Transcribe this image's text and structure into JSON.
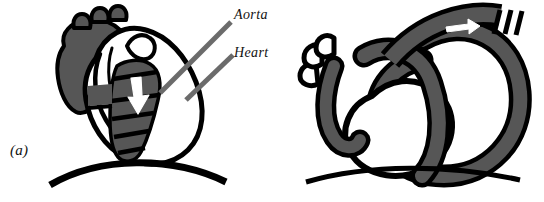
{
  "figure": {
    "background_color": "#ffffff",
    "ink_color": "#000000",
    "tissue_gray": "#565656",
    "leader_gray": "#6b6b6b",
    "highlight_color": "#ffffff"
  },
  "panels": [
    {
      "id": "a",
      "label": "(a)",
      "description": "stylised heart with aorta band",
      "callouts": [
        {
          "name": "aorta",
          "label": "Aorta"
        },
        {
          "name": "heart",
          "label": "Heart"
        }
      ],
      "flow_arrow": {
        "name": "aorta-flow-arrow",
        "direction": "down"
      }
    },
    {
      "id": "b",
      "label": "(b)",
      "description": "unrolled looping tube schematic",
      "callouts": [],
      "flow_arrow": {
        "name": "tube-flow-arrow",
        "direction": "right"
      }
    }
  ]
}
